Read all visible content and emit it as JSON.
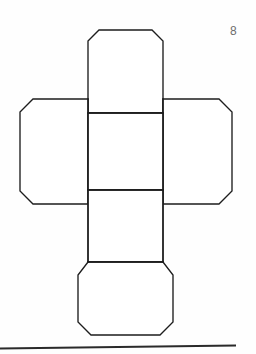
{
  "page": {
    "background_color": "#fefefe",
    "width": 256,
    "height": 354
  },
  "figure": {
    "number_label": "8",
    "title": "",
    "stroke_color": "#1d1d1d",
    "fill_color": "#ffffff",
    "stroke_width": 1.35,
    "panel_count": 6
  },
  "footer": {
    "rule_color": "#2a2a2a",
    "rule_label": "page-bottom-rule"
  },
  "geometry": {
    "center_square": {
      "left": 88,
      "top": 113,
      "right": 163,
      "bottom": 190
    },
    "top_panel": {
      "left": 88,
      "top": 30,
      "right": 163,
      "bottom": 113,
      "chamfer": 11
    },
    "bottom_panel": {
      "left": 78,
      "top": 262,
      "right": 173,
      "bottom": 335,
      "chamfer": 13
    },
    "left_panel": {
      "left": 20,
      "top": 99,
      "right": 88,
      "bottom": 204,
      "chamfer": 13
    },
    "right_panel": {
      "left": 163,
      "top": 99,
      "right": 232,
      "bottom": 204,
      "chamfer": 13
    },
    "stem_panel": {
      "left": 88,
      "top": 190,
      "right": 163,
      "bottom": 262
    },
    "footer_rule": {
      "x1": 0,
      "y1": 348,
      "x2": 236,
      "y2": 345
    }
  }
}
